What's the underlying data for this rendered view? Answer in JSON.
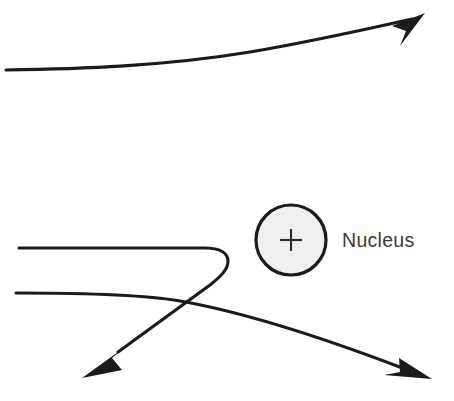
{
  "diagram": {
    "background_color": "#ffffff",
    "stroke_color": "#1b1b1b",
    "stroke_width": 3.1,
    "width": 454,
    "height": 401
  },
  "nucleus": {
    "label": "Nucleus",
    "charge_symbol": "+",
    "label_color": "#3a3a3a",
    "fill_color": "#efefef",
    "outline_color": "#1b1b1b",
    "center_x": 291,
    "center_y": 240,
    "radius": 35,
    "label_x": 342,
    "label_y": 247
  },
  "trajectories": [
    {
      "name": "upper-grazing-path",
      "description": "Distant alpha particle, slight upward deflection",
      "path": "M 6,70 C 80,69 165,66 250,52 C 320,40 380,26 412,19",
      "arrow_tip_x": 425,
      "arrow_tip_y": 13,
      "arrow_points": "425,13 392,26 406,31 400,46",
      "deflection": "small"
    },
    {
      "name": "upper-backscatter-path",
      "description": "Close approach alpha particle, near back-scatter U-turn",
      "path": "M 19,248 L 205,248 C 220,248 228,253 228,261 C 228,270 220,277 210,285 L 118,352",
      "arrow_tip_x": 82,
      "arrow_tip_y": 378,
      "arrow_points": "82,378 122,370 112,358 125,347",
      "deflection": "large"
    },
    {
      "name": "lower-deflected-path",
      "description": "Intermediate alpha particle, moderate downward deflection",
      "path": "M 16,293 C 80,293 140,294 180,301 C 260,315 350,348 405,369",
      "arrow_tip_x": 432,
      "arrow_tip_y": 379,
      "arrow_points": "432,379 399,358 400,372 384,375",
      "deflection": "moderate"
    }
  ]
}
